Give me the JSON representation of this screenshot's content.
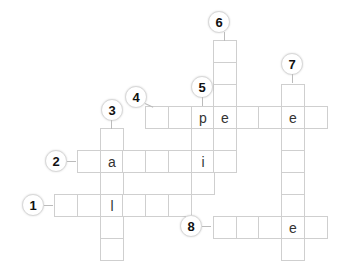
{
  "puzzle": {
    "type": "crossword",
    "clues": [
      {
        "number": "1",
        "direction": "across"
      },
      {
        "number": "2",
        "direction": "across"
      },
      {
        "number": "3",
        "direction": "down"
      },
      {
        "number": "4",
        "direction": "across"
      },
      {
        "number": "5",
        "direction": "down"
      },
      {
        "number": "6",
        "direction": "down"
      },
      {
        "number": "7",
        "direction": "down"
      },
      {
        "number": "8",
        "direction": "across"
      }
    ],
    "given_letters": {
      "w4_p": "p",
      "w4_e1": "e",
      "w4_e2": "e",
      "w2_a": "a",
      "w2_i": "i",
      "w1_l": "l",
      "w8_e": "e"
    }
  }
}
